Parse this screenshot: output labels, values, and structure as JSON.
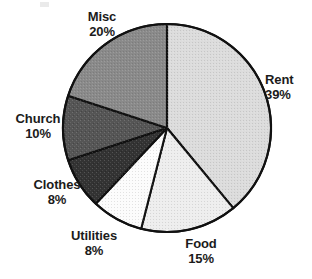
{
  "chart_data": {
    "type": "pie",
    "title": "",
    "subtitle": "",
    "xlabel": "",
    "ylabel": "",
    "legend_position": "none",
    "grid": false,
    "labels_outside": true,
    "start_angle_deg": 0,
    "direction": "clockwise",
    "categories": [
      "Rent",
      "Food",
      "Utilities",
      "Clothes",
      "Church",
      "Misc"
    ],
    "values": [
      39,
      15,
      8,
      8,
      10,
      20
    ],
    "units": "percent",
    "total": 100,
    "slices": [
      {
        "label": "Rent",
        "value": 39,
        "value_text": "39%",
        "color": "#dcdcdc"
      },
      {
        "label": "Food",
        "value": 15,
        "value_text": "15%",
        "color": "#eeeeee"
      },
      {
        "label": "Utilities",
        "value": 8,
        "value_text": "8%",
        "color": "#fcfcfc"
      },
      {
        "label": "Clothes",
        "value": 8,
        "value_text": "8%",
        "color": "#333333"
      },
      {
        "label": "Church",
        "value": 10,
        "value_text": "10%",
        "color": "#555555"
      },
      {
        "label": "Misc",
        "value": 20,
        "value_text": "20%",
        "color": "#8a8a8a"
      }
    ]
  },
  "chart": {
    "center_x": 167,
    "center_y": 128,
    "radius": 104,
    "outline_color": "#111111"
  },
  "labels": {
    "misc": {
      "name": "Misc",
      "value": "20%"
    },
    "rent": {
      "name": "Rent",
      "value": "39%"
    },
    "food": {
      "name": "Food",
      "value": "15%"
    },
    "utilities": {
      "name": "Utilities",
      "value": "8%"
    },
    "clothes": {
      "name": "Clothes",
      "value": "8%"
    },
    "church": {
      "name": "Church",
      "value": "10%"
    }
  }
}
